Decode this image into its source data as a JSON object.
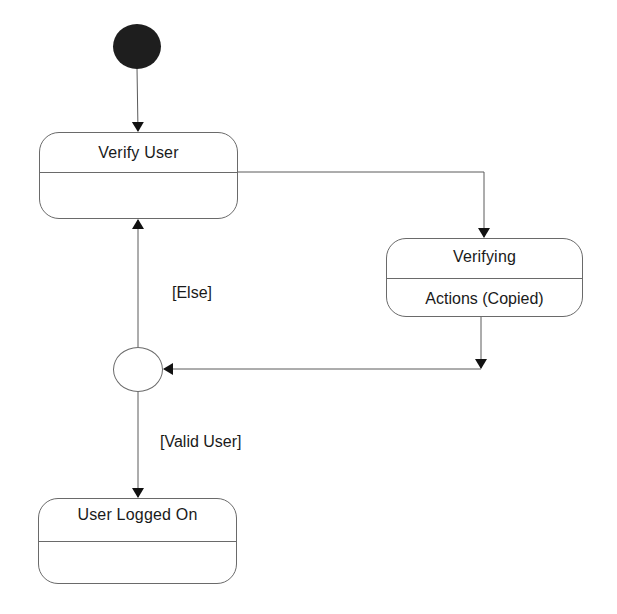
{
  "diagram": {
    "type": "UML state machine",
    "colors": {
      "line": "#5a5a5a",
      "initial_fill": "#1e1e1e",
      "text": "#1a1a1a"
    },
    "initial_node": {
      "label": ""
    },
    "states": [
      {
        "id": "verify_user",
        "name": "Verify User",
        "actions": ""
      },
      {
        "id": "verifying",
        "name": "Verifying",
        "actions": "Actions (Copied)"
      },
      {
        "id": "user_logged_on",
        "name": "User Logged On",
        "actions": ""
      }
    ],
    "decision": {
      "label": ""
    },
    "guards": {
      "else": "[Else]",
      "valid_user": "[Valid User]"
    },
    "transitions": [
      {
        "from": "initial",
        "to": "verify_user",
        "guard": ""
      },
      {
        "from": "verify_user",
        "to": "verifying",
        "guard": ""
      },
      {
        "from": "verifying",
        "to": "decision",
        "guard": ""
      },
      {
        "from": "decision",
        "to": "verify_user",
        "guard": "[Else]"
      },
      {
        "from": "decision",
        "to": "user_logged_on",
        "guard": "[Valid User]"
      }
    ]
  }
}
